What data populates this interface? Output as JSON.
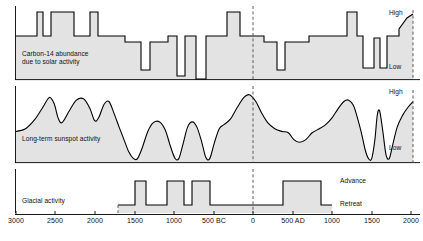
{
  "figure": {
    "background": "#ffffff",
    "fill_color": "#e3e3e3",
    "line_color": "#000000",
    "dash_color": "#4a4a4a"
  },
  "axis": {
    "label_bc": "BC",
    "label_ad": "AD",
    "zero_marker_year": 0,
    "ticks": [
      {
        "label": "3000",
        "year": -3000,
        "x": 16
      },
      {
        "label": "2500",
        "year": -2500,
        "x": 55
      },
      {
        "label": "2000",
        "year": -2000,
        "x": 95
      },
      {
        "label": "1500",
        "year": -1500,
        "x": 135
      },
      {
        "label": "1000",
        "year": -1000,
        "x": 174
      },
      {
        "label": "500 BC",
        "year": -500,
        "x": 214
      },
      {
        "label": "0",
        "year": 0,
        "x": 253
      },
      {
        "label": "500 AD",
        "year": 500,
        "x": 293
      },
      {
        "label": "1000",
        "year": 1000,
        "x": 332
      },
      {
        "label": "1500",
        "year": 1500,
        "x": 372
      },
      {
        "label": "2000",
        "year": 2000,
        "x": 411
      }
    ]
  },
  "panels": [
    {
      "id": "carbon14",
      "label": "Carbon-14 abundance\ndue to solar activity",
      "high_label": "High",
      "low_label": "Low"
    },
    {
      "id": "sunspot",
      "label": "Long-term sunspot activity",
      "high_label": "High",
      "low_label": "Low"
    },
    {
      "id": "glacial",
      "label": "Glacial activity",
      "high_label": "Advance",
      "low_label": "Retreat"
    }
  ],
  "chart_data": {
    "type": "line",
    "xlabel": "Year (BC / AD)",
    "ylabel": "",
    "xlim": [
      -3000,
      2000
    ],
    "grid": false,
    "legend": "none",
    "annotations": [
      {
        "text": "High",
        "panel": "carbon14",
        "position": "top-right"
      },
      {
        "text": "Low",
        "panel": "carbon14",
        "position": "bottom-right"
      },
      {
        "text": "High",
        "panel": "sunspot",
        "position": "top-right"
      },
      {
        "text": "Low",
        "panel": "sunspot",
        "position": "bottom-right"
      },
      {
        "text": "Advance",
        "panel": "glacial",
        "position": "top-right"
      },
      {
        "text": "Retreat",
        "panel": "glacial",
        "position": "bottom-right"
      },
      {
        "text": "vertical dashed reference line at year 0",
        "panel": "all",
        "position": "x=0"
      }
    ],
    "series": [
      {
        "name": "Carbon-14 abundance due to solar activity",
        "panel": "carbon14",
        "shape": "step",
        "ylim": [
          0,
          1
        ],
        "ylabels": [
          "Low",
          "High"
        ],
        "points": [
          [
            -3000,
            0.62
          ],
          [
            -2730,
            0.62
          ],
          [
            -2730,
            1.0
          ],
          [
            -2660,
            1.0
          ],
          [
            -2660,
            0.62
          ],
          [
            -2560,
            0.62
          ],
          [
            -2560,
            1.0
          ],
          [
            -2270,
            1.0
          ],
          [
            -2270,
            0.62
          ],
          [
            -2060,
            0.62
          ],
          [
            -2060,
            1.0
          ],
          [
            -1960,
            1.0
          ],
          [
            -1960,
            0.62
          ],
          [
            -1620,
            0.62
          ],
          [
            -1620,
            0.55
          ],
          [
            -1420,
            0.55
          ],
          [
            -1420,
            0.2
          ],
          [
            -1310,
            0.2
          ],
          [
            -1310,
            0.55
          ],
          [
            -1080,
            0.55
          ],
          [
            -1080,
            0.62
          ],
          [
            -960,
            0.62
          ],
          [
            -960,
            0.12
          ],
          [
            -860,
            0.12
          ],
          [
            -860,
            0.62
          ],
          [
            -720,
            0.62
          ],
          [
            -720,
            0.05
          ],
          [
            -600,
            0.05
          ],
          [
            -600,
            0.62
          ],
          [
            -330,
            0.62
          ],
          [
            -330,
            1.0
          ],
          [
            -170,
            1.0
          ],
          [
            -170,
            0.62
          ],
          [
            130,
            0.62
          ],
          [
            130,
            0.55
          ],
          [
            300,
            0.55
          ],
          [
            300,
            0.2
          ],
          [
            400,
            0.2
          ],
          [
            400,
            0.55
          ],
          [
            700,
            0.55
          ],
          [
            700,
            0.62
          ],
          [
            1180,
            0.62
          ],
          [
            1180,
            1.0
          ],
          [
            1300,
            1.0
          ],
          [
            1300,
            0.62
          ],
          [
            1380,
            0.62
          ],
          [
            1380,
            0.22
          ],
          [
            1520,
            0.22
          ],
          [
            1520,
            0.6
          ],
          [
            1600,
            0.6
          ],
          [
            1600,
            0.22
          ],
          [
            1680,
            0.22
          ],
          [
            1680,
            0.62
          ],
          [
            1830,
            0.62
          ],
          [
            1830,
            0.72
          ],
          [
            1930,
            0.95
          ],
          [
            2000,
            1.0
          ]
        ]
      },
      {
        "name": "Long-term sunspot activity",
        "panel": "sunspot",
        "shape": "smooth",
        "ylim": [
          0,
          1
        ],
        "ylabels": [
          "Low",
          "High"
        ],
        "points": [
          [
            -3000,
            0.42
          ],
          [
            -2880,
            0.46
          ],
          [
            -2760,
            0.6
          ],
          [
            -2660,
            0.78
          ],
          [
            -2580,
            0.92
          ],
          [
            -2520,
            0.83
          ],
          [
            -2470,
            0.62
          ],
          [
            -2420,
            0.55
          ],
          [
            -2330,
            0.72
          ],
          [
            -2240,
            0.88
          ],
          [
            -2150,
            0.9
          ],
          [
            -2070,
            0.76
          ],
          [
            -2010,
            0.58
          ],
          [
            -1960,
            0.62
          ],
          [
            -1890,
            0.82
          ],
          [
            -1830,
            0.86
          ],
          [
            -1770,
            0.7
          ],
          [
            -1700,
            0.48
          ],
          [
            -1640,
            0.3
          ],
          [
            -1580,
            0.12
          ],
          [
            -1520,
            0.02
          ],
          [
            -1470,
            0.02
          ],
          [
            -1410,
            0.18
          ],
          [
            -1340,
            0.42
          ],
          [
            -1270,
            0.55
          ],
          [
            -1190,
            0.56
          ],
          [
            -1120,
            0.44
          ],
          [
            -1060,
            0.22
          ],
          [
            -1000,
            0.03
          ],
          [
            -950,
            0.02
          ],
          [
            -900,
            0.22
          ],
          [
            -840,
            0.48
          ],
          [
            -780,
            0.56
          ],
          [
            -720,
            0.48
          ],
          [
            -660,
            0.26
          ],
          [
            -610,
            0.04
          ],
          [
            -560,
            0.02
          ],
          [
            -500,
            0.26
          ],
          [
            -440,
            0.46
          ],
          [
            -380,
            0.52
          ],
          [
            -300,
            0.6
          ],
          [
            -220,
            0.76
          ],
          [
            -130,
            0.92
          ],
          [
            -60,
            0.96
          ],
          [
            20,
            0.86
          ],
          [
            90,
            0.7
          ],
          [
            170,
            0.55
          ],
          [
            260,
            0.46
          ],
          [
            350,
            0.42
          ],
          [
            430,
            0.4
          ],
          [
            500,
            0.3
          ],
          [
            570,
            0.26
          ],
          [
            650,
            0.3
          ],
          [
            730,
            0.4
          ],
          [
            820,
            0.46
          ],
          [
            900,
            0.52
          ],
          [
            980,
            0.62
          ],
          [
            1060,
            0.76
          ],
          [
            1130,
            0.86
          ],
          [
            1190,
            0.88
          ],
          [
            1250,
            0.8
          ],
          [
            1300,
            0.62
          ],
          [
            1350,
            0.4
          ],
          [
            1400,
            0.14
          ],
          [
            1440,
            0.02
          ],
          [
            1480,
            0.02
          ],
          [
            1520,
            0.3
          ],
          [
            1550,
            0.66
          ],
          [
            1580,
            0.72
          ],
          [
            1620,
            0.42
          ],
          [
            1660,
            0.08
          ],
          [
            1700,
            0.02
          ],
          [
            1740,
            0.2
          ],
          [
            1800,
            0.48
          ],
          [
            1870,
            0.66
          ],
          [
            1940,
            0.78
          ],
          [
            2000,
            0.86
          ]
        ]
      },
      {
        "name": "Glacial activity",
        "panel": "glacial",
        "shape": "step",
        "ylim": [
          0,
          1
        ],
        "ylabels": [
          "Retreat",
          "Advance"
        ],
        "points": [
          [
            -1700,
            0.0
          ],
          [
            -1400,
            0.0
          ],
          [
            -1400,
            1.0
          ],
          [
            -1270,
            1.0
          ],
          [
            -1270,
            0.0
          ],
          [
            -1000,
            0.0
          ],
          [
            -1000,
            1.0
          ],
          [
            -790,
            1.0
          ],
          [
            -790,
            0.0
          ],
          [
            -700,
            0.0
          ],
          [
            -700,
            1.0
          ],
          [
            -470,
            1.0
          ],
          [
            -470,
            0.0
          ],
          [
            380,
            0.0
          ],
          [
            380,
            1.0
          ],
          [
            870,
            1.0
          ],
          [
            870,
            0.0
          ],
          [
            1000,
            0.0
          ]
        ]
      }
    ]
  }
}
